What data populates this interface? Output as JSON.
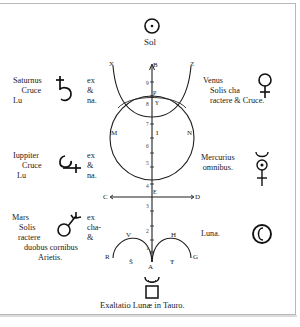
{
  "top": {
    "symbol": "sun-symbol",
    "label": "Sol"
  },
  "left_column": [
    {
      "name": "saturn",
      "lines": [
        "Saturnus",
        "Cruce",
        "Lu"
      ],
      "right_lines": [
        "ex",
        "&",
        "na."
      ],
      "symbol": "saturn-symbol"
    },
    {
      "name": "jupiter",
      "lines": [
        "Iuppiter",
        "Cruce",
        "Lu"
      ],
      "right_lines": [
        "ex",
        "&",
        "na."
      ],
      "symbol": "jupiter-symbol"
    },
    {
      "name": "mars",
      "lines": [
        "Mars",
        "Solis",
        "ractere",
        "duobus cornibus",
        "Arietis."
      ],
      "right_lines": [
        "ex",
        "cha-",
        "&"
      ],
      "symbol": "mars-symbol"
    }
  ],
  "right_column": [
    {
      "name": "venus",
      "lines": [
        "Venus",
        "Solis cha",
        "ractere & Cruce."
      ],
      "symbol": "venus-symbol"
    },
    {
      "name": "mercury",
      "lines": [
        "Mercurius",
        "omnibus."
      ],
      "symbol": "mercury-symbol"
    },
    {
      "name": "moon",
      "lines": [
        "Luna."
      ],
      "symbol": "moon-symbol"
    }
  ],
  "diagram_letters": {
    "X": "X",
    "Z": "Z",
    "B": "B",
    "P": "P",
    "Y": "Y",
    "M": "M",
    "N": "N",
    "I": "I",
    "C": "C",
    "D": "D",
    "E": "E",
    "R": "R",
    "G": "G",
    "V": "V",
    "H": "H",
    "A": "A",
    "S": "Š",
    "T": "Ŧ"
  },
  "axis_numbers": [
    "9",
    "8",
    "7",
    "6",
    "5",
    "4",
    "3",
    "2",
    "1"
  ],
  "bottom": {
    "symbol": "taurus-exaltation-symbol",
    "caption": "Exaltatio Lunæ in Tauro."
  }
}
